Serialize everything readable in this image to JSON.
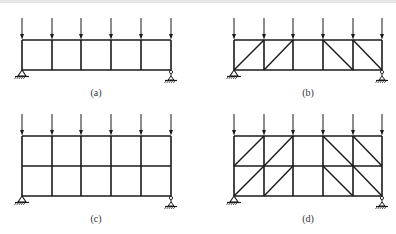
{
  "figure": {
    "stroke_color": "#1a1a1a",
    "panels": [
      {
        "id": "a",
        "label": "(a)",
        "label_pos": [
          96,
          95
        ],
        "columns_x": [
          22,
          52,
          81,
          111,
          141,
          171
        ],
        "levels_y": [
          40,
          70
        ],
        "arrow_top_y": 18,
        "diagonals": []
      },
      {
        "id": "b",
        "label": "(b)",
        "label_pos": [
          308,
          95
        ],
        "columns_x": [
          234,
          264,
          293,
          323,
          353,
          382
        ],
        "levels_y": [
          40,
          70
        ],
        "arrow_top_y": 18,
        "diagonals": [
          {
            "bay": 0,
            "story": 0,
            "dir": "/"
          },
          {
            "bay": 1,
            "story": 0,
            "dir": "/"
          },
          {
            "bay": 3,
            "story": 0,
            "dir": "\\"
          },
          {
            "bay": 4,
            "story": 0,
            "dir": "\\"
          }
        ]
      },
      {
        "id": "c",
        "label": "(c)",
        "label_pos": [
          96,
          221
        ],
        "columns_x": [
          22,
          52,
          81,
          111,
          141,
          171
        ],
        "levels_y": [
          136,
          166,
          196
        ],
        "arrow_top_y": 114,
        "diagonals": []
      },
      {
        "id": "d",
        "label": "(d)",
        "label_pos": [
          308,
          221
        ],
        "columns_x": [
          234,
          264,
          293,
          323,
          353,
          382
        ],
        "levels_y": [
          136,
          166,
          196
        ],
        "arrow_top_y": 114,
        "diagonals": [
          {
            "bay": 0,
            "story": 0,
            "dir": "/"
          },
          {
            "bay": 1,
            "story": 0,
            "dir": "/"
          },
          {
            "bay": 3,
            "story": 0,
            "dir": "\\"
          },
          {
            "bay": 4,
            "story": 0,
            "dir": "\\"
          },
          {
            "bay": 0,
            "story": 1,
            "dir": "/"
          },
          {
            "bay": 1,
            "story": 1,
            "dir": "/"
          },
          {
            "bay": 3,
            "story": 1,
            "dir": "\\"
          },
          {
            "bay": 4,
            "story": 1,
            "dir": "\\"
          }
        ]
      }
    ]
  }
}
